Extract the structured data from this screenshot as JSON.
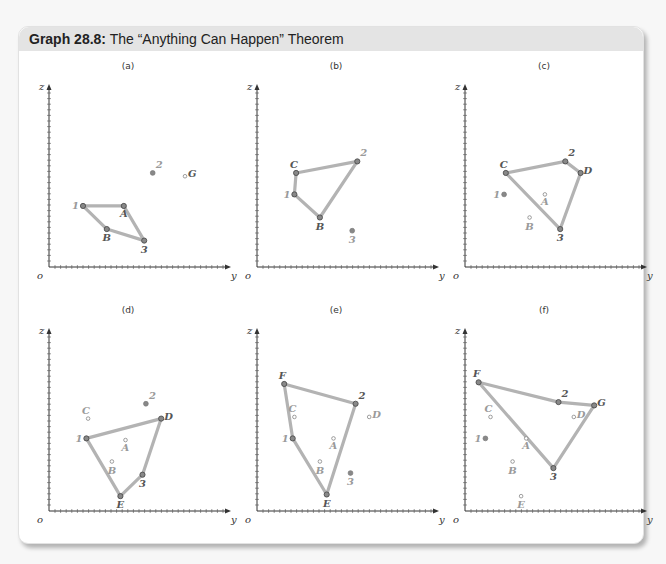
{
  "header": {
    "title_bold": "Graph 28.8:",
    "title_rest": " The “Anything Can Happen” Theorem"
  },
  "axes": {
    "x_label": "y",
    "y_label": "z",
    "origin_label": "o"
  },
  "colors": {
    "line": "#b3b3b3",
    "point": "#666666",
    "label_active": "#555555",
    "label_faded": "#9a9a9a",
    "header_bg": "#e4e4e4"
  },
  "chart_data": {
    "type": "diagram",
    "title": "Graph 28.8: The “Anything Can Happen” Theorem",
    "panels": [
      {
        "label": "(a)",
        "points": [
          {
            "name": "1",
            "x": 20,
            "y": 37,
            "active": true,
            "faded_label": true
          },
          {
            "name": "A",
            "x": 44,
            "y": 37,
            "active": true
          },
          {
            "name": "B",
            "x": 34,
            "y": 23,
            "active": true
          },
          {
            "name": "3",
            "x": 56,
            "y": 16,
            "active": true
          },
          {
            "name": "2",
            "x": 61,
            "y": 57,
            "active": false,
            "faded_label": true
          },
          {
            "name": "G",
            "x": 80,
            "y": 55,
            "active": false
          }
        ],
        "polygon": [
          "1",
          "A",
          "3",
          "B"
        ]
      },
      {
        "label": "(b)",
        "points": [
          {
            "name": "C",
            "x": 23,
            "y": 57,
            "active": true
          },
          {
            "name": "2",
            "x": 59,
            "y": 64,
            "active": true,
            "faded_label": true
          },
          {
            "name": "1",
            "x": 22,
            "y": 44,
            "active": true,
            "faded_label": true
          },
          {
            "name": "B",
            "x": 37,
            "y": 30,
            "active": true
          },
          {
            "name": "3",
            "x": 56,
            "y": 22,
            "active": false,
            "faded_label": true
          }
        ],
        "polygon": [
          "C",
          "2",
          "B",
          "1"
        ]
      },
      {
        "label": "(c)",
        "points": [
          {
            "name": "C",
            "x": 24,
            "y": 57,
            "active": true
          },
          {
            "name": "2",
            "x": 59,
            "y": 64,
            "active": true
          },
          {
            "name": "D",
            "x": 68,
            "y": 57,
            "active": true
          },
          {
            "name": "3",
            "x": 56,
            "y": 23,
            "active": true
          },
          {
            "name": "1",
            "x": 23,
            "y": 44,
            "active": false,
            "faded_label": true
          },
          {
            "name": "A",
            "x": 47,
            "y": 44,
            "active": false,
            "faded_label": true
          },
          {
            "name": "B",
            "x": 38,
            "y": 30,
            "active": false,
            "faded_label": true
          }
        ],
        "polygon": [
          "C",
          "2",
          "D",
          "3"
        ]
      },
      {
        "label": "(d)",
        "points": [
          {
            "name": "1",
            "x": 22,
            "y": 44,
            "active": true,
            "faded_label": true
          },
          {
            "name": "D",
            "x": 66,
            "y": 56,
            "active": true
          },
          {
            "name": "3",
            "x": 55,
            "y": 22,
            "active": true
          },
          {
            "name": "E",
            "x": 42,
            "y": 9,
            "active": true
          },
          {
            "name": "2",
            "x": 57,
            "y": 65,
            "active": false,
            "faded_label": true
          },
          {
            "name": "C",
            "x": 23,
            "y": 56,
            "active": false,
            "faded_label": true
          },
          {
            "name": "A",
            "x": 45,
            "y": 43,
            "active": false,
            "faded_label": true
          },
          {
            "name": "B",
            "x": 37,
            "y": 30,
            "active": false,
            "faded_label": true
          }
        ],
        "polygon": [
          "1",
          "D",
          "3",
          "E"
        ]
      },
      {
        "label": "(e)",
        "points": [
          {
            "name": "F",
            "x": 16,
            "y": 77,
            "active": true
          },
          {
            "name": "2",
            "x": 58,
            "y": 65,
            "active": true
          },
          {
            "name": "E",
            "x": 41,
            "y": 10,
            "active": true
          },
          {
            "name": "1",
            "x": 21,
            "y": 44,
            "active": true,
            "faded_label": true
          },
          {
            "name": "C",
            "x": 22,
            "y": 57,
            "active": false,
            "faded_label": true
          },
          {
            "name": "D",
            "x": 66,
            "y": 57,
            "active": false,
            "faded_label": true
          },
          {
            "name": "A",
            "x": 45,
            "y": 44,
            "active": false,
            "faded_label": true
          },
          {
            "name": "B",
            "x": 37,
            "y": 30,
            "active": false,
            "faded_label": true
          },
          {
            "name": "3",
            "x": 55,
            "y": 23,
            "active": false,
            "faded_label": true
          }
        ],
        "polygon": [
          "F",
          "2",
          "E",
          "1"
        ]
      },
      {
        "label": "(f)",
        "points": [
          {
            "name": "F",
            "x": 8,
            "y": 78,
            "active": true
          },
          {
            "name": "2",
            "x": 55,
            "y": 66,
            "active": true
          },
          {
            "name": "G",
            "x": 76,
            "y": 64,
            "active": true
          },
          {
            "name": "3",
            "x": 52,
            "y": 26,
            "active": true
          },
          {
            "name": "C",
            "x": 15,
            "y": 57,
            "active": false,
            "faded_label": true
          },
          {
            "name": "D",
            "x": 64,
            "y": 57,
            "active": false,
            "faded_label": true
          },
          {
            "name": "1",
            "x": 12,
            "y": 44,
            "active": false,
            "faded_label": true
          },
          {
            "name": "A",
            "x": 36,
            "y": 44,
            "active": false,
            "faded_label": true
          },
          {
            "name": "B",
            "x": 28,
            "y": 30,
            "active": false,
            "faded_label": true
          },
          {
            "name": "E",
            "x": 33,
            "y": 9,
            "active": false,
            "faded_label": true
          }
        ],
        "polygon": [
          "F",
          "2",
          "G",
          "3"
        ]
      }
    ],
    "xlabel": "y",
    "ylabel": "z",
    "xlim": [
      0,
      100
    ],
    "ylim": [
      0,
      100
    ],
    "grid": false
  }
}
